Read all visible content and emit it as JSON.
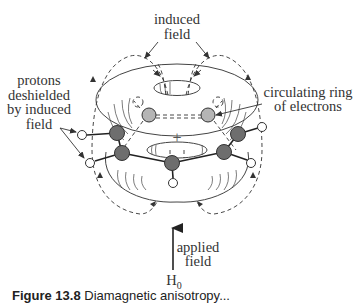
{
  "diagram": {
    "type": "benzene-ring-current-diamagnetic-anisotropy",
    "labels": {
      "induced_field_line1": "induced",
      "induced_field_line2": "field",
      "protons_line1": "protons",
      "protons_line2": "deshielded",
      "protons_line3": "by induced",
      "protons_line4": "field",
      "ring_line1": "circulating ring",
      "ring_line2": "of electrons",
      "applied_line1": "applied",
      "applied_line2": "field",
      "h0_main": "H",
      "h0_sub": "0",
      "center_symbol": "+"
    },
    "caption": {
      "bold": "Figure 13.8",
      "rest": " Diamagnetic anisotropy..."
    },
    "colors": {
      "line": "#333333",
      "carbon_dark": "#6e6e6e",
      "carbon_light": "#b5b5b5",
      "hydrogen": "#ffffff",
      "background": "#ffffff"
    }
  }
}
